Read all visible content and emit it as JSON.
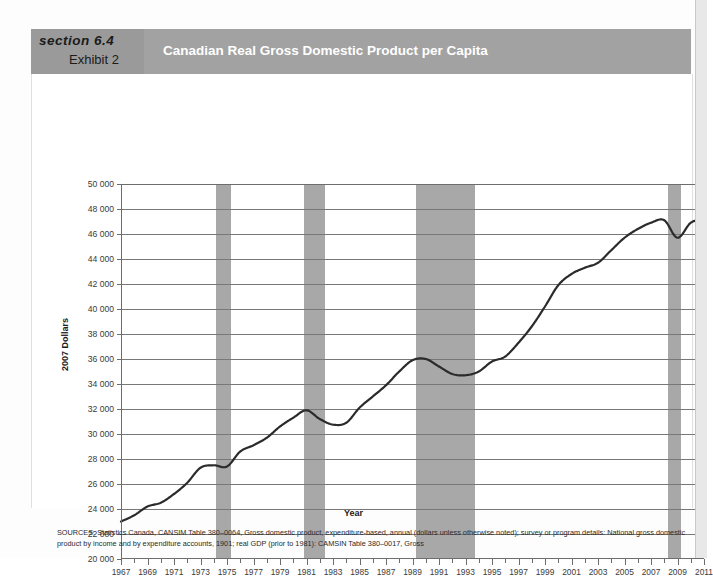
{
  "header": {
    "section_label": "section 6.4",
    "exhibit_label": "Exhibit 2",
    "title": "Canadian Real Gross Domestic Product per Capita",
    "band_color": "#a2a2a2",
    "left_block_color": "#9a9a9a",
    "title_color": "#ffffff"
  },
  "sources": {
    "text": "SOURCES: Statistics Canada, CANSIM Table 380–0064, Gross domestic product, expenditure-based, annual (dollars unless otherwise noted); survey or program details: National gross domestic product by income and by expenditure accounts, 1901; real GDP (prior to 1981): CAMSIN Table 380–0017, Gross"
  },
  "chart_data": {
    "type": "line",
    "title": "Canadian Real Gross Domestic Product per Capita",
    "xlabel": "Year",
    "ylabel": "2007 Dollars",
    "xlim": [
      1967,
      2011
    ],
    "ylim": [
      20000,
      50000
    ],
    "grid": true,
    "legend": "none",
    "line_color": "#2b2b2b",
    "recession_band_color": "#a8a8a8",
    "ytick_labels": [
      "20 000",
      "22 000",
      "24 000",
      "26 000",
      "28 000",
      "30 000",
      "32 000",
      "34 000",
      "36 000",
      "38 000",
      "40 000",
      "42 000",
      "44 000",
      "46 000",
      "48 000",
      "50 000"
    ],
    "ytick_values": [
      20000,
      22000,
      24000,
      26000,
      28000,
      30000,
      32000,
      34000,
      36000,
      38000,
      40000,
      42000,
      44000,
      46000,
      48000,
      50000
    ],
    "xtick_labels": [
      "1967",
      "1969",
      "1971",
      "1973",
      "1975",
      "1977",
      "1979",
      "1981",
      "1983",
      "1985",
      "1987",
      "1989",
      "1991",
      "1993",
      "1995",
      "1997",
      "1999",
      "2001",
      "2003",
      "2005",
      "2007",
      "2009",
      "2011"
    ],
    "xtick_values": [
      1967,
      1969,
      1971,
      1973,
      1975,
      1977,
      1979,
      1981,
      1983,
      1985,
      1987,
      1989,
      1991,
      1993,
      1995,
      1997,
      1999,
      2001,
      2003,
      2005,
      2007,
      2009,
      2011
    ],
    "minor_xticks_every": 1,
    "recession_bands": [
      {
        "start": 1974.2,
        "end": 1975.3
      },
      {
        "start": 1980.8,
        "end": 1982.4
      },
      {
        "start": 1989.3,
        "end": 1993.7
      },
      {
        "start": 2008.3,
        "end": 2009.3
      }
    ],
    "x": [
      1967,
      1968,
      1969,
      1970,
      1971,
      1972,
      1973,
      1974,
      1975,
      1976,
      1977,
      1978,
      1979,
      1980,
      1981,
      1982,
      1983,
      1984,
      1985,
      1986,
      1987,
      1988,
      1989,
      1990,
      1991,
      1992,
      1993,
      1994,
      1995,
      1996,
      1997,
      1998,
      1999,
      2000,
      2001,
      2002,
      2003,
      2004,
      2005,
      2006,
      2007,
      2008,
      2009,
      2010,
      2011
    ],
    "values": [
      23000,
      23500,
      24200,
      24500,
      25200,
      26100,
      27300,
      27500,
      27400,
      28600,
      29100,
      29700,
      30600,
      31300,
      31900,
      31200,
      30750,
      30900,
      32100,
      33000,
      33900,
      35000,
      35900,
      36000,
      35400,
      34800,
      34700,
      35000,
      35800,
      36200,
      37300,
      38600,
      40200,
      41900,
      42800,
      43300,
      43700,
      44700,
      45700,
      46400,
      46900,
      47100,
      45700,
      46900,
      47200
    ],
    "series": [
      {
        "name": "Real GDP per capita (2007 dollars)",
        "values": [
          23000,
          23500,
          24200,
          24500,
          25200,
          26100,
          27300,
          27500,
          27400,
          28600,
          29100,
          29700,
          30600,
          31300,
          31900,
          31200,
          30750,
          30900,
          32100,
          33000,
          33900,
          35000,
          35900,
          36000,
          35400,
          34800,
          34700,
          35000,
          35800,
          36200,
          37300,
          38600,
          40200,
          41900,
          42800,
          43300,
          43700,
          44700,
          45700,
          46400,
          46900,
          47100,
          45700,
          46900,
          47200
        ]
      }
    ]
  }
}
